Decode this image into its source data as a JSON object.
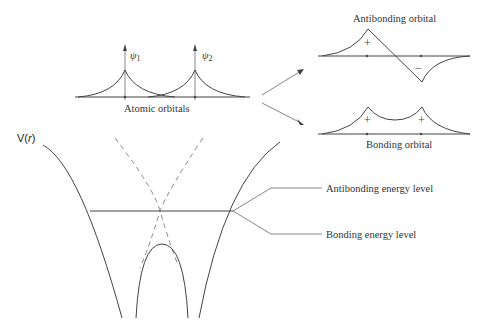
{
  "atomic_panel": {
    "psi1_label": "ψ",
    "psi1_sub": "1",
    "psi2_label": "ψ",
    "psi2_sub": "2",
    "caption": "Atomic orbitals"
  },
  "antibonding_panel": {
    "title": "Antibonding orbital",
    "plus_sign": "+",
    "minus_sign": "−"
  },
  "bonding_panel": {
    "caption": "Bonding orbital",
    "plus_left": "+",
    "plus_right": "+"
  },
  "potential_panel": {
    "v_label": "V(",
    "v_var": "r",
    "v_close": ")",
    "antibonding_level_label": "Antibonding energy level",
    "bonding_level_label": "Bonding energy level"
  },
  "colors": {
    "line": "#444444",
    "dashed": "#888888",
    "background": "#ffffff"
  }
}
